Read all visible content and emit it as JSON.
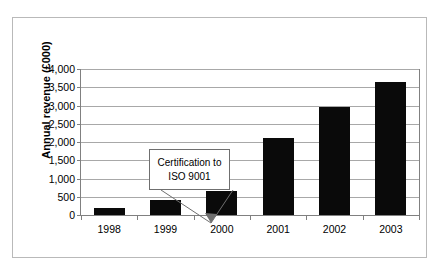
{
  "chart_data": {
    "type": "bar",
    "title": "",
    "xlabel": "",
    "ylabel": "Annual revenue (£000)",
    "categories": [
      "1998",
      "1999",
      "2000",
      "2001",
      "2002",
      "2003"
    ],
    "values": [
      200,
      420,
      650,
      2100,
      2950,
      3650
    ],
    "series": [
      {
        "name": "Annual revenue",
        "values": [
          200,
          420,
          650,
          2100,
          2950,
          3650
        ],
        "color": "#0a0a0a"
      }
    ],
    "ylim": [
      0,
      4000
    ],
    "ytick_values": [
      0,
      500,
      1000,
      1500,
      2000,
      2500,
      3000,
      3500,
      4000
    ],
    "ytick_labels": [
      "0",
      "500",
      "1,000",
      "1,500",
      "2,000",
      "2,500",
      "3,000",
      "3,500",
      "4,000"
    ],
    "grid": true,
    "legend": false,
    "legend_position": "none",
    "annotations": [
      {
        "id": "iso-certification",
        "lines": [
          "Certification to",
          "ISO 9001"
        ],
        "points_to_category": "2000"
      }
    ]
  },
  "colors": {
    "bar": "#0a0a0a",
    "gridline": "#a8a8a8",
    "axis": "#808080",
    "frame": "#b9b9b9",
    "text": "#000000",
    "background": "#ffffff"
  }
}
